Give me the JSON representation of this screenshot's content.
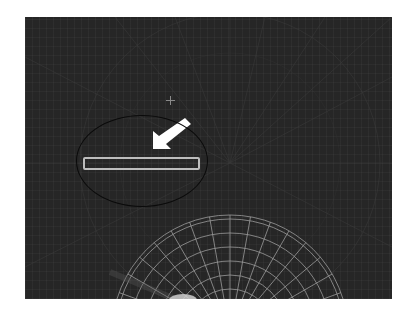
{
  "canvas": {
    "background_color": "#262626",
    "grid_color": "#3a3a3a"
  },
  "input_field": {
    "value": "",
    "placeholder": "",
    "border_color": "#bdbdbd"
  },
  "annotation": {
    "arrow_color": "#ffffff",
    "ellipse_color": "#0a0a0a",
    "arrow_icon": "arrow-down-left-icon"
  },
  "crosshair": {
    "icon": "crosshair-icon",
    "color": "#8a8a8a"
  },
  "wireframe": {
    "type": "radial-grid-dome",
    "line_color": "#9a9a9a"
  }
}
